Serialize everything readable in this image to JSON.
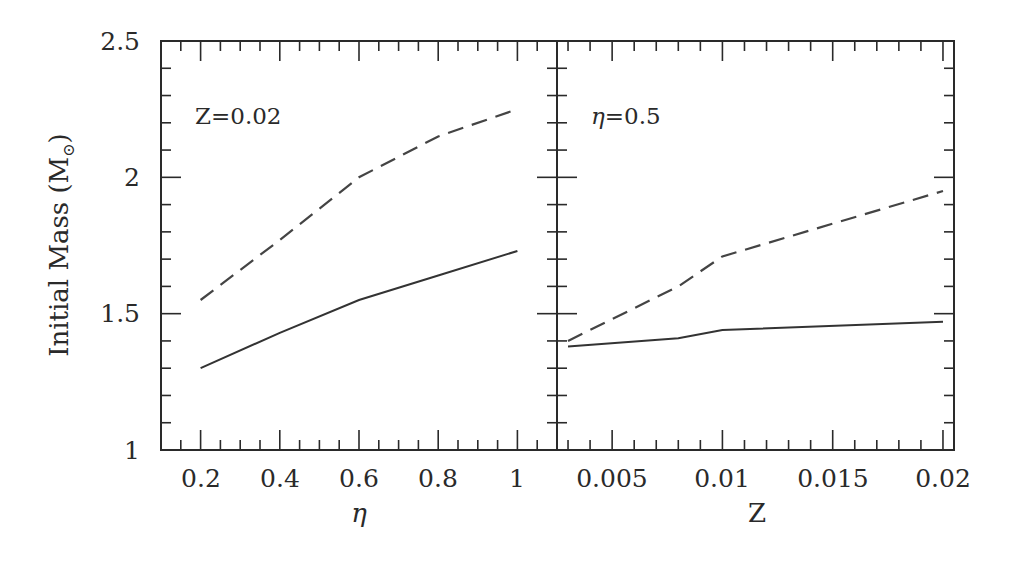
{
  "chart_data": [
    {
      "type": "line",
      "panel": "left",
      "annotation": "Z=0.02",
      "xlabel": "η",
      "ylabel": "Initial Mass (M⊙)",
      "xlim": [
        0.1,
        1.1
      ],
      "ylim": [
        1,
        2.5
      ],
      "xticks": [
        "0.2",
        "0.4",
        "0.6",
        "0.8",
        "1"
      ],
      "yticks": [
        "1",
        "1.5",
        "2",
        "2.5"
      ],
      "grid": false,
      "legend": null,
      "series": [
        {
          "name": "upper (dashed)",
          "style": "dashed",
          "x": [
            0.2,
            0.4,
            0.6,
            0.8,
            1.0
          ],
          "values": [
            1.55,
            1.77,
            2.0,
            2.15,
            2.25
          ]
        },
        {
          "name": "lower (solid)",
          "style": "solid",
          "x": [
            0.2,
            0.4,
            0.6,
            0.8,
            1.0
          ],
          "values": [
            1.3,
            1.43,
            1.55,
            1.64,
            1.73
          ]
        }
      ]
    },
    {
      "type": "line",
      "panel": "right",
      "annotation": "η=0.5",
      "xlabel": "Z",
      "ylabel": "Initial Mass (M⊙)",
      "xlim": [
        0.0025,
        0.0205
      ],
      "ylim": [
        1,
        2.5
      ],
      "xticks": [
        "0.005",
        "0.01",
        "0.015",
        "0.02"
      ],
      "grid": false,
      "legend": null,
      "series": [
        {
          "name": "upper (dashed)",
          "style": "dashed",
          "x": [
            0.003,
            0.008,
            0.01,
            0.02
          ],
          "values": [
            1.4,
            1.6,
            1.71,
            1.95
          ]
        },
        {
          "name": "lower (solid)",
          "style": "solid",
          "x": [
            0.003,
            0.008,
            0.01,
            0.02
          ],
          "values": [
            1.38,
            1.41,
            1.44,
            1.47
          ]
        }
      ]
    }
  ],
  "labels": {
    "ylabel": "Initial Mass (M",
    "ylabel_sub": "⊙",
    "ylabel_close": ")",
    "left_xlabel": "η",
    "right_xlabel": "Z",
    "left_annotation": "Z=0.02",
    "right_annotation_eta": "η",
    "right_annotation_val": "=0.5"
  },
  "ticks": {
    "y": [
      "1",
      "1.5",
      "2",
      "2.5"
    ],
    "left_x": [
      "0.2",
      "0.4",
      "0.6",
      "0.8",
      "1"
    ],
    "right_x": [
      "0.005",
      "0.01",
      "0.015",
      "0.02"
    ]
  }
}
